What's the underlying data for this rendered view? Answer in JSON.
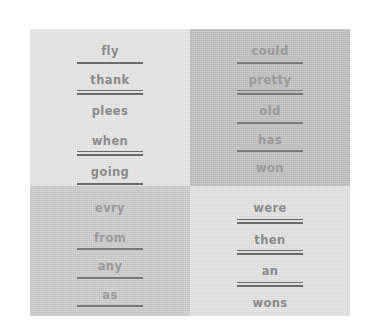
{
  "worksheet": {
    "quadrants": [
      {
        "name": "top-left",
        "background": "#e3e3e3",
        "words": [
          {
            "text": "fly",
            "underline": "single"
          },
          {
            "text": "thank",
            "underline": "double"
          },
          {
            "text": "plees",
            "underline": "none"
          },
          {
            "text": "when",
            "underline": "double"
          },
          {
            "text": "going",
            "underline": "single"
          }
        ]
      },
      {
        "name": "top-right",
        "background": "#bdbdbd",
        "words": [
          {
            "text": "could",
            "underline": "single"
          },
          {
            "text": "pretty",
            "underline": "double"
          },
          {
            "text": "old",
            "underline": "single"
          },
          {
            "text": "has",
            "underline": "single"
          },
          {
            "text": "won",
            "underline": "none"
          }
        ]
      },
      {
        "name": "bottom-left",
        "background": "#c9c9c9",
        "words": [
          {
            "text": "evry",
            "underline": "none"
          },
          {
            "text": "from",
            "underline": "single"
          },
          {
            "text": "any",
            "underline": "single"
          },
          {
            "text": "as",
            "underline": "single"
          }
        ]
      },
      {
        "name": "bottom-right",
        "background": "#e0e0e0",
        "words": [
          {
            "text": "were",
            "underline": "double"
          },
          {
            "text": "then",
            "underline": "double"
          },
          {
            "text": "an",
            "underline": "double"
          },
          {
            "text": "wons",
            "underline": "none"
          }
        ]
      }
    ]
  },
  "colors": {
    "page_background": "#ffffff",
    "ink": "#8b8b8b",
    "rule": "#6a6a6a"
  }
}
